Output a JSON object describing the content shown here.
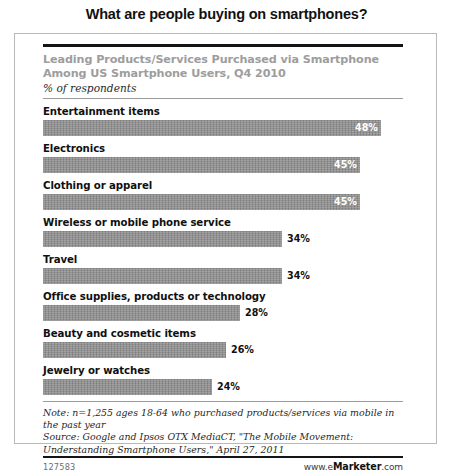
{
  "page_title": "What are people buying on smartphones?",
  "chart_header": {
    "title_line1": "Leading Products/Services Purchased via Smartphone",
    "title_line2": "Among US Smartphone Users, Q4 2010",
    "subtitle": "% of respondents"
  },
  "notes": {
    "note_line1": "Note: n=1,255 ages 18-64 who purchased products/services via mobile in",
    "note_line2": "the past year",
    "source_line1": "Source: Google and Ipsos OTX MediaCT, \"The Mobile Movement:",
    "source_line2": "Understanding Smartphone Users,\" April 27, 2011"
  },
  "footer": {
    "id": "127583",
    "brand_prefix": "www.e",
    "brand_strong": "Marketer",
    "brand_suffix": ".com"
  },
  "colors": {
    "bar": "#8d8d8d",
    "header_title": "#9d9d9d",
    "rule_dark": "#141414",
    "rule_light": "#9b9b9b",
    "frame": "#b9b9b9"
  },
  "chart_data": {
    "type": "bar",
    "orientation": "horizontal",
    "title": "Leading Products/Services Purchased via Smartphone Among US Smartphone Users, Q4 2010",
    "subtitle": "% of respondents",
    "xlabel": "",
    "ylabel": "",
    "xlim": [
      0,
      48
    ],
    "grid": false,
    "legend": false,
    "value_suffix": "%",
    "categories": [
      "Entertainment items",
      "Electronics",
      "Clothing or apparel",
      "Wireless or mobile phone service",
      "Travel",
      "Office supplies, products or technology",
      "Beauty and cosmetic items",
      "Jewelry or watches"
    ],
    "values": [
      48,
      45,
      45,
      34,
      34,
      28,
      26,
      24
    ],
    "bars": [
      {
        "label": "Entertainment items",
        "value": 48,
        "value_text": "48%",
        "label_inside": true
      },
      {
        "label": "Electronics",
        "value": 45,
        "value_text": "45%",
        "label_inside": true
      },
      {
        "label": "Clothing or apparel",
        "value": 45,
        "value_text": "45%",
        "label_inside": true
      },
      {
        "label": "Wireless or mobile phone service",
        "value": 34,
        "value_text": "34%",
        "label_inside": false
      },
      {
        "label": "Travel",
        "value": 34,
        "value_text": "34%",
        "label_inside": false
      },
      {
        "label": "Office supplies, products or technology",
        "value": 28,
        "value_text": "28%",
        "label_inside": false
      },
      {
        "label": "Beauty and cosmetic items",
        "value": 26,
        "value_text": "26%",
        "label_inside": false
      },
      {
        "label": "Jewelry or watches",
        "value": 24,
        "value_text": "24%",
        "label_inside": false
      }
    ]
  }
}
